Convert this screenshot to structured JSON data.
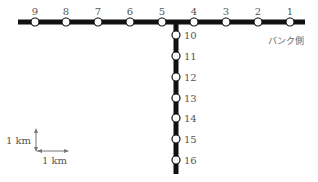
{
  "diagram": {
    "horizontal_stations": [
      {
        "label": "9",
        "x": 35
      },
      {
        "label": "8",
        "x": 66
      },
      {
        "label": "7",
        "x": 98
      },
      {
        "label": "6",
        "x": 130
      },
      {
        "label": "5",
        "x": 162
      },
      {
        "label": "4",
        "x": 194
      },
      {
        "label": "3",
        "x": 226
      },
      {
        "label": "2",
        "x": 258
      },
      {
        "label": "1",
        "x": 290
      }
    ],
    "vertical_stations": [
      {
        "label": "10",
        "y": 35
      },
      {
        "label": "11",
        "y": 56
      },
      {
        "label": "12",
        "y": 77
      },
      {
        "label": "13",
        "y": 98
      },
      {
        "label": "14",
        "y": 118
      },
      {
        "label": "15",
        "y": 139
      },
      {
        "label": "16",
        "y": 160
      }
    ],
    "side_label": "バンク側",
    "scale": {
      "vertical_label": "1 km",
      "horizontal_label": "1 km"
    },
    "colors": {
      "line": "#111111",
      "station_fill": "#ffffff",
      "text": "#555555"
    }
  }
}
